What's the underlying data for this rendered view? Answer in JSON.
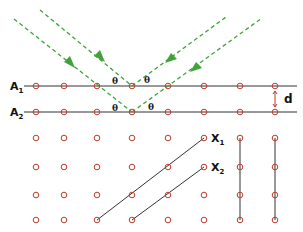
{
  "diagram": {
    "planes": [
      {
        "label": "A",
        "sub": "1",
        "y": 86
      },
      {
        "label": "A",
        "sub": "2",
        "y": 112
      }
    ],
    "spacing_label": "d",
    "angle_label": "θ",
    "diagonal_planes": [
      {
        "label": "X",
        "sub": "1"
      },
      {
        "label": "X",
        "sub": "2"
      }
    ],
    "colors": {
      "ray": "#3fa33a",
      "atom": "#c0392b",
      "line": "#222222",
      "spacing_arrow": "#c0392b"
    },
    "lattice": {
      "columns_x": [
        36,
        64,
        97,
        132,
        168,
        204,
        240,
        275
      ],
      "rows_y": [
        86,
        112,
        138,
        167,
        195,
        220
      ]
    }
  }
}
